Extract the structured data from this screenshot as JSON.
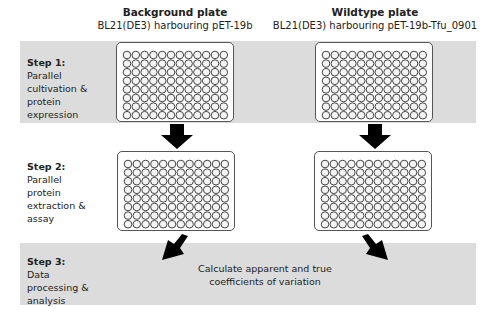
{
  "headers": {
    "background": {
      "title": "Background plate",
      "subtitle": "BL21(DE3) harbouring pET-19b"
    },
    "wildtype": {
      "title": "Wildtype plate",
      "subtitle": "BL21(DE3) harbouring pET-19b-Tfu_0901"
    }
  },
  "steps": [
    {
      "title": "Step 1:",
      "lines": [
        "Parallel",
        "cultivation &",
        "protein",
        "expression"
      ]
    },
    {
      "title": "Step 2:",
      "lines": [
        "Parallel",
        "protein",
        "extraction &",
        "assay"
      ]
    },
    {
      "title": "Step 3:",
      "lines": [
        "Data",
        "processing &",
        "analysis"
      ]
    }
  ],
  "calc": {
    "line1": "Calculate apparent and true",
    "line2": "coefficients of variation"
  },
  "plate": {
    "rows": [
      "A",
      "B",
      "C",
      "D",
      "E",
      "F",
      "G",
      "H"
    ],
    "cols": 12
  },
  "colors": {
    "band": "#dcdcdc",
    "arrow": "#000000"
  }
}
